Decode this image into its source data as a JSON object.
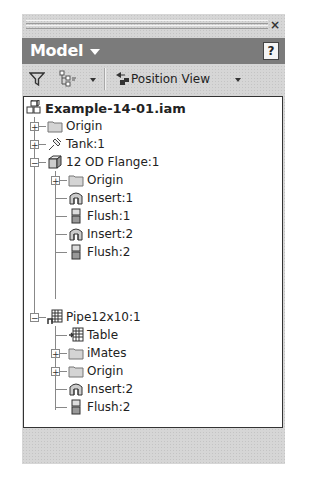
{
  "panel": {
    "close_label": "×",
    "header": {
      "title": "Model",
      "help_label": "?"
    },
    "toolbar": {
      "filter_icon": "filter-funnel-icon",
      "display_icon": "tree-display-icon",
      "position_view_label": "Position View"
    }
  },
  "tree": {
    "root": {
      "label": "Example-14-01.iam",
      "icon": "assembly-icon"
    },
    "items": [
      {
        "label": "Origin",
        "icon": "folder-icon",
        "expander": "+"
      },
      {
        "label": "Tank:1",
        "icon": "grounded-part-icon",
        "expander": "+"
      },
      {
        "label": "12 OD Flange:1",
        "icon": "part-icon",
        "expander": "−"
      },
      {
        "label": "Origin",
        "icon": "folder-icon",
        "expander": "+"
      },
      {
        "label": "Insert:1",
        "icon": "insert-constraint-icon"
      },
      {
        "label": "Flush:1",
        "icon": "flush-constraint-icon"
      },
      {
        "label": "Insert:2",
        "icon": "insert-constraint-icon"
      },
      {
        "label": "Flush:2",
        "icon": "flush-constraint-icon"
      },
      {
        "label": "Pipe12x10:1",
        "icon": "iPart-table-icon",
        "expander": "−"
      },
      {
        "label": "Table",
        "icon": "table-icon"
      },
      {
        "label": "iMates",
        "icon": "folder-icon",
        "expander": "+"
      },
      {
        "label": "Origin",
        "icon": "folder-icon",
        "expander": "+"
      },
      {
        "label": "Insert:2",
        "icon": "insert-constraint-icon"
      },
      {
        "label": "Flush:2",
        "icon": "flush-constraint-icon"
      }
    ]
  }
}
